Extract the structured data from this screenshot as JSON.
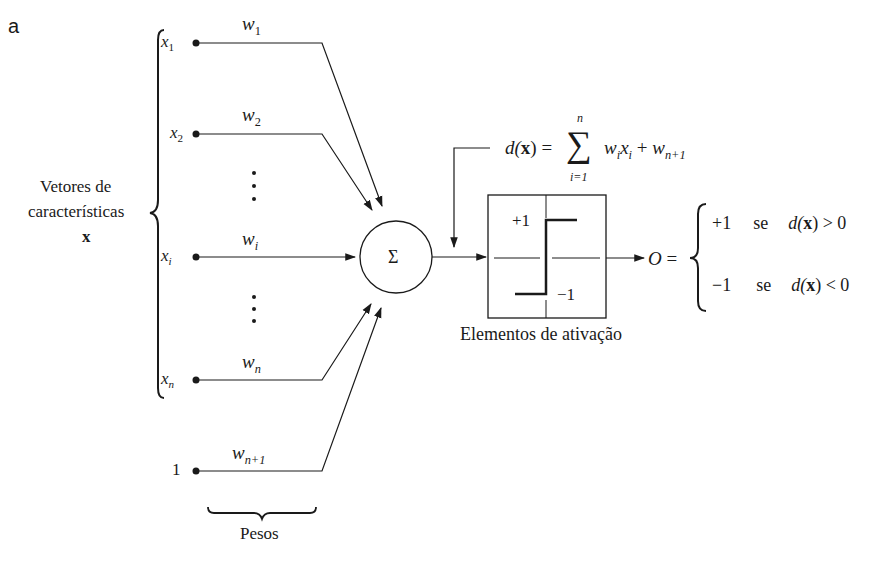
{
  "panel_label": "a",
  "feature_vector_label": {
    "line1": "Vetores de",
    "line2": "características",
    "line3": "x"
  },
  "inputs": [
    {
      "var": "x",
      "sub": "1",
      "weight": "w",
      "weight_sub": "1"
    },
    {
      "var": "x",
      "sub": "2",
      "weight": "w",
      "weight_sub": "2"
    },
    {
      "var": "x",
      "sub": "i",
      "weight": "w",
      "weight_sub": "i"
    },
    {
      "var": "x",
      "sub": "n",
      "weight": "w",
      "weight_sub": "n"
    },
    {
      "var": "1",
      "sub": "",
      "weight": "w",
      "weight_sub": "n+1"
    }
  ],
  "weights_label": "Pesos",
  "sum_symbol": "Σ",
  "formula": {
    "lhs": "d(",
    "bold_x": "x",
    "rhs_close": ") =",
    "sigma": "∑",
    "upper": "n",
    "lower": "i=1",
    "term": "w",
    "term_sub_i": "i",
    "term_x": "x",
    "term_x_sub": "i",
    "plus": "+",
    "bias": "w",
    "bias_sub": "n+1"
  },
  "activation": {
    "plus_label": "+1",
    "minus_label": "−1",
    "caption": "Elementos de ativação"
  },
  "output": {
    "symbol": "O =",
    "cases": [
      {
        "value": "+1",
        "cond_word": "se",
        "cond_pre": "d(",
        "cond_x": "x",
        "cond_post": ") > 0"
      },
      {
        "value": "−1",
        "cond_word": "se",
        "cond_pre": "d(",
        "cond_x": "x",
        "cond_post": ") < 0"
      }
    ]
  },
  "colors": {
    "ink": "#1a1a1a",
    "background": "#ffffff"
  }
}
